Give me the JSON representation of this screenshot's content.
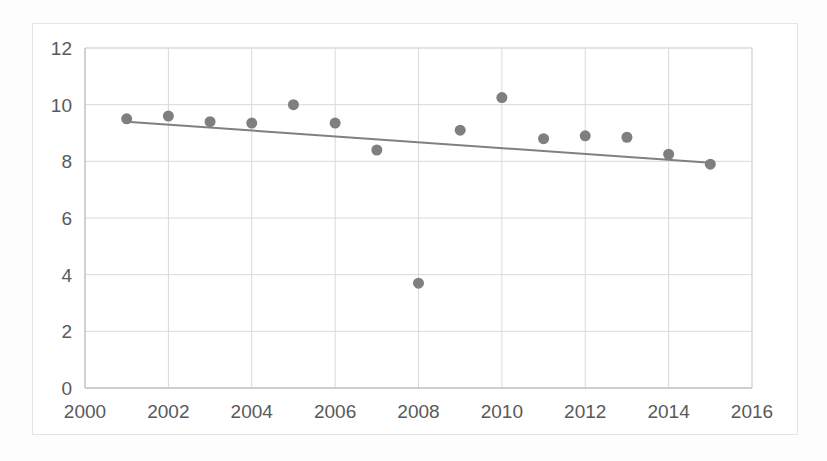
{
  "figure": {
    "background_color": "#fdfdfd",
    "plot_background_color": "#ffffff",
    "border_color": "#e4e4e4"
  },
  "chart_data": {
    "type": "scatter",
    "title": "",
    "subtitle": "",
    "xlabel": "",
    "ylabel": "",
    "xlim": [
      2000,
      2016
    ],
    "ylim": [
      0,
      12
    ],
    "xticks": [
      2000,
      2002,
      2004,
      2006,
      2008,
      2010,
      2012,
      2014,
      2016
    ],
    "xtick_labels": [
      "2000",
      "2002",
      "2004",
      "2006",
      "2008",
      "2010",
      "2012",
      "2014",
      "2016"
    ],
    "yticks": [
      0,
      2,
      4,
      6,
      8,
      10,
      12
    ],
    "ytick_labels": [
      "0",
      "2",
      "4",
      "6",
      "8",
      "10",
      "12"
    ],
    "grid": true,
    "grid_color": "#d9d9d9",
    "legend": false,
    "legend_position": "none",
    "marker_color": "#7f7f7f",
    "marker_size": 11,
    "series": [
      {
        "name": "data",
        "type": "scatter",
        "x": [
          2001,
          2002,
          2003,
          2004,
          2005,
          2006,
          2007,
          2008,
          2009,
          2010,
          2011,
          2012,
          2013,
          2014,
          2015
        ],
        "values": [
          9.5,
          9.6,
          9.4,
          9.35,
          10.0,
          9.35,
          8.4,
          3.7,
          9.1,
          10.25,
          8.8,
          8.9,
          8.85,
          8.25,
          7.9
        ]
      },
      {
        "name": "linear-trendline",
        "type": "line",
        "color": "#808080",
        "x": [
          2001,
          2015
        ],
        "values": [
          9.4,
          7.95
        ]
      }
    ],
    "annotations": [
      {
        "text": "outlier low value at 2008",
        "x": 2008,
        "y": 3.7
      }
    ]
  }
}
